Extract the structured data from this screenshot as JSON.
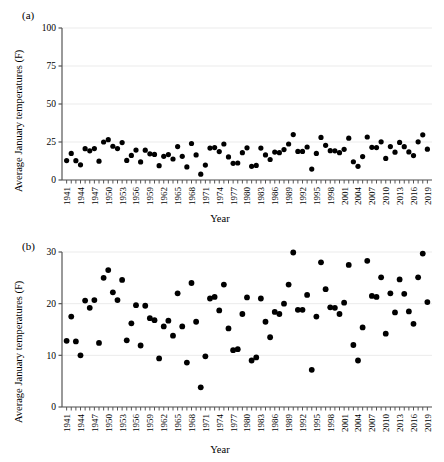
{
  "figure": {
    "panels": [
      {
        "tag": "(a)",
        "ylabel": "Average January temperatures (F)",
        "xlabel": "Year"
      },
      {
        "tag": "(b)",
        "ylabel": "Average January temperatures (F)",
        "xlabel": "Year"
      }
    ]
  },
  "chart_data": [
    {
      "type": "scatter",
      "title": "",
      "panel": "(a)",
      "xlabel": "Year",
      "ylabel": "Average January temperatures (F)",
      "xlim": [
        1940,
        2020
      ],
      "ylim": [
        0,
        100
      ],
      "yticks": [
        0,
        25,
        50,
        75,
        100
      ],
      "xticks": [
        1941,
        1944,
        1947,
        1950,
        1953,
        1956,
        1959,
        1962,
        1965,
        1968,
        1971,
        1974,
        1977,
        1980,
        1983,
        1986,
        1989,
        1992,
        1995,
        1998,
        2001,
        2004,
        2007,
        2010,
        2013,
        2016,
        2019
      ],
      "grid": "horizontal-major-light",
      "legend": "none",
      "marker": "filled-circle",
      "marker_color": "#000000",
      "x": [
        1941,
        1942,
        1943,
        1944,
        1945,
        1946,
        1947,
        1948,
        1949,
        1950,
        1951,
        1952,
        1953,
        1954,
        1955,
        1956,
        1957,
        1958,
        1959,
        1960,
        1961,
        1962,
        1963,
        1964,
        1965,
        1966,
        1967,
        1968,
        1969,
        1970,
        1971,
        1972,
        1973,
        1974,
        1975,
        1976,
        1977,
        1978,
        1979,
        1980,
        1981,
        1982,
        1983,
        1984,
        1985,
        1986,
        1987,
        1988,
        1989,
        1990,
        1991,
        1992,
        1993,
        1994,
        1995,
        1996,
        1997,
        1998,
        1999,
        2000,
        2001,
        2002,
        2003,
        2004,
        2005,
        2006,
        2007,
        2008,
        2009,
        2010,
        2011,
        2012,
        2013,
        2014,
        2015,
        2016,
        2017,
        2018,
        2019
      ],
      "y": [
        12.8,
        17.5,
        12.7,
        10.0,
        20.6,
        19.2,
        20.7,
        12.4,
        25.0,
        26.5,
        22.2,
        20.7,
        24.6,
        12.9,
        16.2,
        19.7,
        11.9,
        19.6,
        17.2,
        16.8,
        9.4,
        15.6,
        16.7,
        13.8,
        22.0,
        15.6,
        8.6,
        24.0,
        16.5,
        3.8,
        9.8,
        21.0,
        21.3,
        18.7,
        23.7,
        15.2,
        11.0,
        11.2,
        18.0,
        21.2,
        9.0,
        9.6,
        21.0,
        16.5,
        13.5,
        18.4,
        18.0,
        20.0,
        23.7,
        29.9,
        18.8,
        18.8,
        21.7,
        7.2,
        17.5,
        28.0,
        22.8,
        19.3,
        19.2,
        18.0,
        20.2,
        27.5,
        12.0,
        9.0,
        15.4,
        28.3,
        21.5,
        21.3,
        25.1,
        14.2,
        22.0,
        18.3,
        24.7,
        21.9,
        18.5,
        16.1,
        25.1,
        29.7,
        20.3
      ]
    },
    {
      "type": "scatter",
      "title": "",
      "panel": "(b)",
      "xlabel": "Year",
      "ylabel": "Average January temperatures (F)",
      "xlim": [
        1940,
        2020
      ],
      "ylim": [
        0,
        30
      ],
      "yticks": [
        0,
        10,
        20,
        30
      ],
      "xticks": [
        1941,
        1944,
        1947,
        1950,
        1953,
        1956,
        1959,
        1962,
        1965,
        1968,
        1971,
        1974,
        1977,
        1980,
        1983,
        1986,
        1989,
        1992,
        1995,
        1998,
        2001,
        2004,
        2007,
        2010,
        2013,
        2016,
        2019
      ],
      "grid": "horizontal-major-light",
      "legend": "none",
      "marker": "filled-circle",
      "marker_color": "#000000",
      "x": [
        1941,
        1942,
        1943,
        1944,
        1945,
        1946,
        1947,
        1948,
        1949,
        1950,
        1951,
        1952,
        1953,
        1954,
        1955,
        1956,
        1957,
        1958,
        1959,
        1960,
        1961,
        1962,
        1963,
        1964,
        1965,
        1966,
        1967,
        1968,
        1969,
        1970,
        1971,
        1972,
        1973,
        1974,
        1975,
        1976,
        1977,
        1978,
        1979,
        1980,
        1981,
        1982,
        1983,
        1984,
        1985,
        1986,
        1987,
        1988,
        1989,
        1990,
        1991,
        1992,
        1993,
        1994,
        1995,
        1996,
        1997,
        1998,
        1999,
        2000,
        2001,
        2002,
        2003,
        2004,
        2005,
        2006,
        2007,
        2008,
        2009,
        2010,
        2011,
        2012,
        2013,
        2014,
        2015,
        2016,
        2017,
        2018,
        2019
      ],
      "y": [
        12.8,
        17.5,
        12.7,
        10.0,
        20.6,
        19.2,
        20.7,
        12.4,
        25.0,
        26.5,
        22.2,
        20.7,
        24.6,
        12.9,
        16.2,
        19.7,
        11.9,
        19.6,
        17.2,
        16.8,
        9.4,
        15.6,
        16.7,
        13.8,
        22.0,
        15.6,
        8.6,
        24.0,
        16.5,
        3.8,
        9.8,
        21.0,
        21.3,
        18.7,
        23.7,
        15.2,
        11.0,
        11.2,
        18.0,
        21.2,
        9.0,
        9.6,
        21.0,
        16.5,
        13.5,
        18.4,
        18.0,
        20.0,
        23.7,
        29.9,
        18.8,
        18.8,
        21.7,
        7.2,
        17.5,
        28.0,
        22.8,
        19.3,
        19.2,
        18.0,
        20.2,
        27.5,
        12.0,
        9.0,
        15.4,
        28.3,
        21.5,
        21.3,
        25.1,
        14.2,
        22.0,
        18.3,
        24.7,
        21.9,
        18.5,
        16.1,
        25.1,
        29.7,
        20.3
      ]
    }
  ]
}
